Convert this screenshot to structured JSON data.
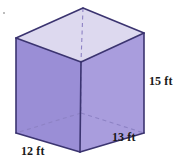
{
  "figure": {
    "name": "rectangular-prism",
    "shape_type": "rectangular prism",
    "units": "ft",
    "colors": {
      "front_face": "#9a8ed6",
      "right_face": "#a99ddd",
      "top_face": "#ddd9ef",
      "edge": "#3b3470",
      "hidden_edge": "#7d72b8",
      "background": "#ffffff",
      "label_text": "#1a1a1a"
    },
    "dimensions": {
      "height": {
        "label": "15 ft",
        "value": 15,
        "unit": "ft",
        "edge": "vertical right"
      },
      "depth": {
        "label": "13 ft",
        "value": 13,
        "unit": "ft",
        "edge": "bottom right"
      },
      "width": {
        "label": "12 ft",
        "value": 12,
        "unit": "ft",
        "edge": "bottom left"
      }
    },
    "geometry": {
      "top_left": "16,38",
      "top_back": "83,8",
      "top_right": "144,33",
      "top_front": "81,62",
      "bottom_left": "16,133",
      "bottom_front": "80,152",
      "bottom_right": "144,133",
      "bottom_back_hidden": "81,113"
    }
  }
}
